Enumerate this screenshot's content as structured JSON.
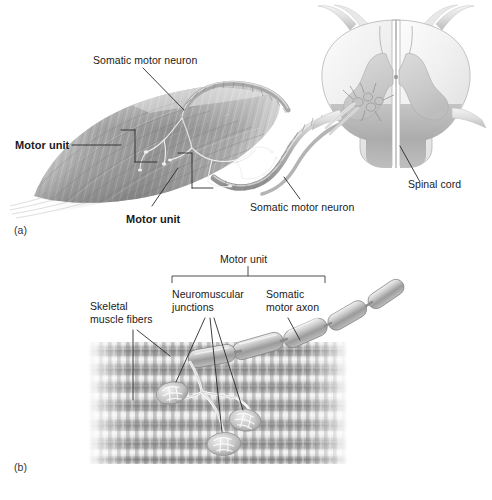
{
  "figure": {
    "background_color": "#ffffff",
    "ink_color": "#1a1a1a"
  },
  "panel_a": {
    "tag": "(a)",
    "labels": {
      "somatic_motor_neuron_top": "Somatic motor neuron",
      "somatic_motor_neuron_bottom": "Somatic motor neuron",
      "motor_unit_upper": "Motor unit",
      "motor_unit_lower": "Motor unit",
      "spinal_cord": "Spinal cord"
    }
  },
  "panel_b": {
    "tag": "(b)",
    "labels": {
      "motor_unit_bracket": "Motor unit",
      "neuromuscular_junctions_line1": "Neuromuscular",
      "neuromuscular_junctions_line2": "junctions",
      "somatic_motor_axon_line1": "Somatic",
      "somatic_motor_axon_line2": "motor axon",
      "skeletal_muscle_fibers_line1": "Skeletal",
      "skeletal_muscle_fibers_line2": "muscle fibers"
    }
  },
  "palette": {
    "muscle_dark": "#7d7d7d",
    "muscle_mid": "#9a9a9a",
    "muscle_light": "#c9c9c9",
    "muscle_pale": "#e8e8e8",
    "cord_white_matter": "#efefef",
    "cord_gray_matter": "#d2d2d2",
    "cord_shadow": "#a8a8a8",
    "nerve": "#b9b9b9",
    "axon": "#d8d8d8",
    "leader_line": "#2a2a2a",
    "fiber_band_dark": "#8b8b8b",
    "fiber_band_light": "#d5d5d5"
  }
}
